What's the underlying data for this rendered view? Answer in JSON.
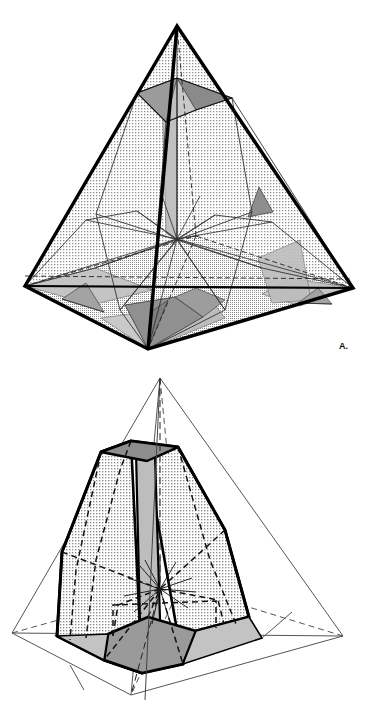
{
  "figure": {
    "type": "line-diagram",
    "panels": [
      {
        "id": "A",
        "label": "A.",
        "caption_text": "A.",
        "description": "Tetrahedron with full internal construction lines, stippled interior faces and shaded triangular facets",
        "outline_style": "heavy-solid",
        "interior_fill": "stipple",
        "vertices": {
          "apex": [
            177,
            26
          ],
          "left": [
            25,
            286
          ],
          "right": [
            353,
            288
          ],
          "front": [
            148,
            349
          ],
          "back_hidden": [
            196,
            236
          ]
        },
        "center_star": [
          177,
          239
        ],
        "upper_truncation": [
          [
            137,
            93
          ],
          [
            177,
            78
          ],
          [
            232,
            98
          ],
          [
            196,
            110
          ]
        ],
        "colors": {
          "outline": "#000000",
          "stipple": "#cfcfcf",
          "light_facet": "#c9c9c9",
          "mid_facet": "#a8a8a8",
          "dark_facet": "#8a8a8a",
          "background": "#ffffff"
        }
      },
      {
        "id": "B",
        "label": "B.",
        "caption_text": "B.",
        "description": "Resulting solid crystal shape (truncated trigonal form) shown inside a thin wireframe tetrahedron",
        "outline_style": "thin-solid-wireframe",
        "interior_fill": "stipple",
        "vertices": {
          "apex": [
            160,
            378
          ],
          "left": [
            12,
            633
          ],
          "right": [
            343,
            636
          ],
          "front": [
            131,
            695
          ],
          "back_hidden": [
            180,
            586
          ]
        },
        "center_star": [
          160,
          589
        ],
        "crystal": {
          "top_face": [
            [
              101,
              452
            ],
            [
              131,
              441
            ],
            [
              178,
              447
            ],
            [
              147,
              461
            ]
          ],
          "bottom_face": [
            [
              108,
              634
            ],
            [
              148,
              617
            ],
            [
              196,
              631
            ],
            [
              183,
              664
            ],
            [
              142,
              673
            ],
            [
              104,
              660
            ]
          ],
          "left_profile": [
            [
              101,
              452
            ],
            [
              62,
              552
            ],
            [
              57,
              636
            ],
            [
              104,
              660
            ]
          ],
          "right_profile": [
            [
              178,
              447
            ],
            [
              225,
              530
            ],
            [
              249,
              617
            ],
            [
              196,
              631
            ]
          ]
        },
        "colors": {
          "outline": "#000000",
          "wireframe": "#555555",
          "stipple": "#cfcfcf",
          "prism_band": "#bdbdbd",
          "dark_facet": "#9a9a9a",
          "top_facet": "#8d8d8d",
          "background": "#ffffff"
        }
      }
    ]
  },
  "canvas": {
    "width": 370,
    "height": 715,
    "background": "#ffffff"
  }
}
